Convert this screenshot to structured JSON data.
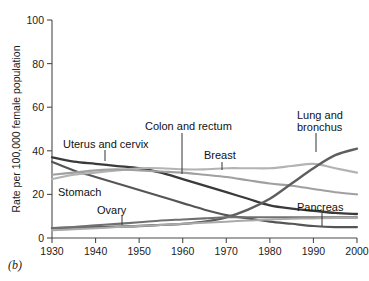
{
  "figure": {
    "panel_label": "(b)"
  },
  "chart_data": {
    "type": "line",
    "title": "",
    "xlabel": "",
    "ylabel": "Rate per 100,000 female population",
    "xlim": [
      1930,
      2000
    ],
    "ylim": [
      0,
      100
    ],
    "xticks": [
      1930,
      1940,
      1950,
      1960,
      1970,
      1980,
      1990,
      2000
    ],
    "xtick_labels": [
      "1930",
      "1940",
      "1950",
      "1960",
      "1970",
      "1980",
      "1990",
      "2000"
    ],
    "yticks": [
      0,
      20,
      40,
      60,
      80,
      100
    ],
    "ytick_labels": [
      "0",
      "20",
      "40",
      "60",
      "80",
      "100"
    ],
    "grid": false,
    "legend_position": "inline-annotations",
    "x": [
      1930,
      1935,
      1940,
      1945,
      1950,
      1955,
      1960,
      1965,
      1970,
      1975,
      1980,
      1985,
      1990,
      1995,
      2000
    ],
    "series": [
      {
        "name": "Uterus and cervix",
        "color": "#3a3a3a",
        "width": 2.3,
        "values": [
          37,
          35,
          34,
          33,
          32,
          30,
          27,
          24,
          21,
          18,
          15,
          13.5,
          12.5,
          11.5,
          11
        ]
      },
      {
        "name": "Stomach",
        "color": "#555555",
        "width": 2.1,
        "values": [
          35,
          31,
          28,
          25,
          22,
          19,
          16,
          13,
          10.5,
          9,
          7.5,
          6.5,
          5.5,
          5,
          5
        ]
      },
      {
        "name": "Breast",
        "color": "#b3b3b3",
        "width": 2.1,
        "values": [
          27,
          29,
          30,
          31,
          32,
          32,
          31.5,
          31.5,
          32,
          32,
          32,
          33,
          34,
          32,
          30
        ]
      },
      {
        "name": "Colon and rectum",
        "color": "#a0a0a0",
        "width": 2.1,
        "values": [
          29,
          30,
          31,
          31.5,
          31,
          30.5,
          30,
          29,
          28,
          26.5,
          25,
          24,
          22.5,
          21,
          20
        ]
      },
      {
        "name": "Lung and bronchus",
        "color": "#5e5e5e",
        "width": 2.4,
        "values": [
          4.5,
          4.8,
          5,
          5.2,
          5.5,
          6,
          6.5,
          7.5,
          9.5,
          13,
          18,
          25,
          32,
          38,
          41
        ]
      },
      {
        "name": "Ovary",
        "color": "#707070",
        "width": 2.1,
        "values": [
          4.5,
          5,
          5.8,
          6.5,
          7.2,
          8,
          8.5,
          9,
          9.5,
          9.5,
          9.5,
          9.5,
          9.5,
          9.5,
          9.5
        ]
      },
      {
        "name": "Pancreas",
        "color": "#aaaaaa",
        "width": 2.0,
        "values": [
          3.5,
          4,
          4.5,
          5,
          5.5,
          6,
          6.5,
          7,
          7.5,
          8,
          8.5,
          8.8,
          9,
          9.2,
          9.2
        ]
      }
    ],
    "annotations": [
      {
        "name": "Uterus and cervix",
        "text": "Uterus and cervix",
        "anchor": "start"
      },
      {
        "name": "Stomach",
        "text": "Stomach",
        "anchor": "start"
      },
      {
        "name": "Ovary",
        "text": "Ovary",
        "anchor": "start"
      },
      {
        "name": "Colon and rectum",
        "text": "Colon and rectum",
        "anchor": "start"
      },
      {
        "name": "Breast",
        "text": "Breast",
        "anchor": "start"
      },
      {
        "name": "Lung and bronchus",
        "text_line1": "Lung and",
        "text_line2": "bronchus",
        "anchor": "start"
      },
      {
        "name": "Pancreas",
        "text": "Pancreas",
        "anchor": "start"
      }
    ]
  }
}
